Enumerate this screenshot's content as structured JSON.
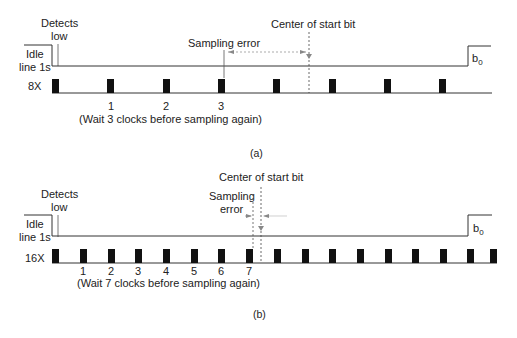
{
  "panel_a": {
    "caption": "(a)",
    "detects_low_line1": "Detects",
    "detects_low_line2": "low",
    "idle_line1": "Idle",
    "idle_line2": "line 1s",
    "center_label": "Center of start bit",
    "sampling_error_label": "Sampling error",
    "clock_label": "8X",
    "b0_label": "b",
    "b0_sub": "0",
    "tick_labels": [
      "1",
      "2",
      "3"
    ],
    "wait_note": "(Wait 3 clocks before sampling again)",
    "pulse_x": [
      53,
      108,
      163,
      218,
      274,
      329,
      384,
      440
    ]
  },
  "panel_b": {
    "caption": "(b)",
    "detects_low_line1": "Detects",
    "detects_low_line2": "low",
    "idle_line1": "Idle",
    "idle_line2": "line 1s",
    "center_label": "Center of start bit",
    "sampling_error_line1": "Sampling",
    "sampling_error_line2": "error",
    "clock_label": "16X",
    "b0_label": "b",
    "b0_sub": "0",
    "tick_labels": [
      "1",
      "2",
      "3",
      "4",
      "5",
      "6",
      "7"
    ],
    "wait_note": "(Wait 7 clocks before sampling again)",
    "pulse_x": [
      53,
      81,
      109,
      137,
      165,
      193,
      221,
      248,
      276,
      304,
      332,
      359,
      387,
      415,
      443,
      469,
      490
    ]
  }
}
